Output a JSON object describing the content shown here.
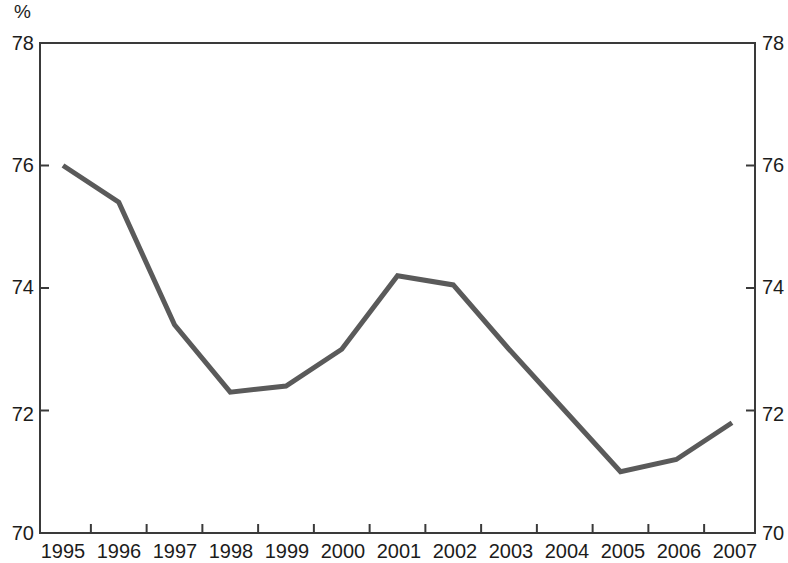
{
  "chart_data": {
    "type": "line",
    "title": "",
    "subtitle": "",
    "xlabel": "",
    "ylabel": "%",
    "unit_label": "%",
    "categories": [
      "1995",
      "1996",
      "1997",
      "1998",
      "1999",
      "2000",
      "2001",
      "2002",
      "2003",
      "2004",
      "2005",
      "2006",
      "2007"
    ],
    "x": [
      1995,
      1996,
      1997,
      1998,
      1999,
      2000,
      2001,
      2002,
      2003,
      2004,
      2005,
      2006,
      2007
    ],
    "values": [
      76.0,
      75.4,
      73.4,
      72.3,
      72.4,
      73.0,
      74.2,
      74.05,
      73.0,
      72.0,
      71.0,
      71.2,
      71.8
    ],
    "series": [
      {
        "name": "",
        "values": [
          76.0,
          75.4,
          73.4,
          72.3,
          72.4,
          73.0,
          74.2,
          74.05,
          73.0,
          72.0,
          71.0,
          71.2,
          71.8
        ],
        "color": "#5a5a5a"
      }
    ],
    "ylim": [
      70,
      78
    ],
    "xlim": [
      1995,
      2007
    ],
    "y_ticks": [
      70,
      72,
      74,
      76,
      78
    ],
    "y_tick_labels_left": [
      "70",
      "72",
      "74",
      "76",
      "78"
    ],
    "y_tick_labels_right": [
      "70",
      "72",
      "74",
      "76",
      "78"
    ],
    "x_tick_labels": [
      "1995",
      "1996",
      "1997",
      "1998",
      "1999",
      "2000",
      "2001",
      "2002",
      "2003",
      "2004",
      "2005",
      "2006",
      "2007"
    ],
    "grid": false,
    "legend": false,
    "legend_position": "none",
    "line_color": "#5a5a5a",
    "line_width": 5,
    "axis_color": "#3a3a3a",
    "background": "#ffffff",
    "annotations": []
  }
}
